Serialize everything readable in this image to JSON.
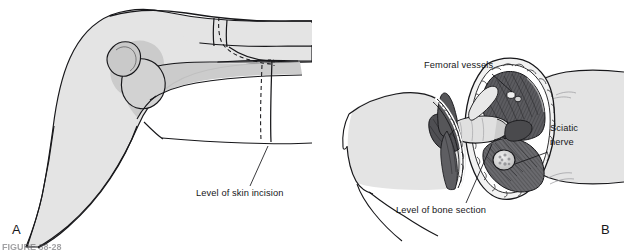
{
  "figure": {
    "background_color": "#ffffff",
    "ink_color": "#17171a",
    "skin_fill": "#e4e4e4",
    "shadow_fill": "#c9c9c9",
    "bone_fill": "#d8d8d8",
    "muscle_dark": "#4a4a4d",
    "muscle_mid": "#6e6e72",
    "fat_light": "#f2f2f2",
    "caption_cut": "FIGURE 38-28"
  },
  "panels": [
    {
      "id": "A",
      "letter": "A",
      "description": "Lateral view of flexed hip and thigh showing planned skin incision",
      "labels": [
        {
          "key": "skin_incision",
          "text": "Level of skin incision",
          "x": 196,
          "y": 196
        }
      ]
    },
    {
      "id": "B",
      "letter": "B",
      "description": "Cross section of thigh stump after bone section with neurovascular structures",
      "labels": [
        {
          "key": "femoral_vessels",
          "text": "Femoral vessels",
          "x": 424,
          "y": 68
        },
        {
          "key": "sciatic_nerve_line1",
          "text": "Sciatic",
          "x": 550,
          "y": 131
        },
        {
          "key": "sciatic_nerve_line2",
          "text": "nerve",
          "x": 550,
          "y": 145
        },
        {
          "key": "bone_section",
          "text": "Level of bone section",
          "x": 396,
          "y": 213
        }
      ]
    }
  ],
  "anatomy_terms": [
    "Femoral vessels",
    "Sciatic nerve",
    "Level of skin incision",
    "Level of bone section"
  ]
}
